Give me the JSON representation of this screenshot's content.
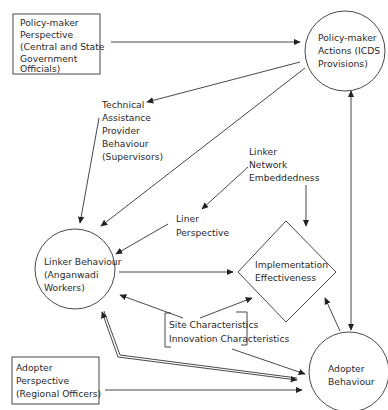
{
  "diagram": {
    "nodes": {
      "policy_perspective": {
        "shape": "rectangle",
        "lines": [
          "Policy-maker",
          "Perspective",
          "(Central and State",
          "Government",
          "Officials)"
        ]
      },
      "policy_actions": {
        "shape": "circle",
        "lines": [
          "Policy-maker",
          "Actions (ICDS",
          "Provisions)"
        ]
      },
      "technical_assistance": {
        "shape": "text",
        "lines": [
          "Technical",
          "Assistance",
          "Provider",
          "Behaviour",
          "(Supervisors)"
        ]
      },
      "linker_network": {
        "shape": "text",
        "lines": [
          "Linker",
          "Network",
          "Embeddedness"
        ]
      },
      "liner_perspective": {
        "shape": "text",
        "lines": [
          "Liner",
          "Perspective"
        ]
      },
      "linker_behaviour": {
        "shape": "circle",
        "lines": [
          "Linker Behaviour",
          "(Anganwadi",
          "Workers)"
        ]
      },
      "implementation": {
        "shape": "diamond",
        "lines": [
          "Implementation",
          "Effectiveness"
        ]
      },
      "characteristics": {
        "shape": "bracket",
        "lines": [
          "Site Characteristics",
          "Innovation Characteristics"
        ]
      },
      "adopter_perspective": {
        "shape": "rectangle",
        "lines": [
          "Adopter",
          "Perspective",
          "(Regional Officers)"
        ]
      },
      "adopter_behaviour": {
        "shape": "circle",
        "lines": [
          "Adopter",
          "Behaviour"
        ]
      }
    },
    "edges": [
      {
        "from": "Policy-maker Perspective",
        "to": "Policy-maker Actions (ICDS Provisions)",
        "style": "single"
      },
      {
        "from": "Policy-maker Actions (ICDS Provisions)",
        "to": "Technical Assistance Provider Behaviour (Supervisors)",
        "style": "single"
      },
      {
        "from": "Policy-maker Actions (ICDS Provisions)",
        "to": "Linker Behaviour (Anganwadi Workers)",
        "style": "single"
      },
      {
        "from": "Technical Assistance Provider Behaviour (Supervisors)",
        "to": "Linker Behaviour (Anganwadi Workers)",
        "style": "single"
      },
      {
        "from": "Linker Network Embeddedness",
        "to": "Liner Perspective",
        "style": "single"
      },
      {
        "from": "Linker Network Embeddedness",
        "to": "Implementation Effectiveness",
        "style": "single"
      },
      {
        "from": "Liner Perspective",
        "to": "Linker Behaviour (Anganwadi Workers)",
        "style": "single"
      },
      {
        "from": "Linker Behaviour (Anganwadi Workers)",
        "to": "Implementation Effectiveness",
        "style": "single"
      },
      {
        "from": "Site/Innovation Characteristics",
        "to": "Linker Behaviour (Anganwadi Workers)",
        "style": "single"
      },
      {
        "from": "Site/Innovation Characteristics",
        "to": "Implementation Effectiveness",
        "style": "single"
      },
      {
        "from": "Site/Innovation Characteristics",
        "to": "Adopter Behaviour",
        "style": "single"
      },
      {
        "from": "Linker Behaviour (Anganwadi Workers)",
        "to": "Adopter Behaviour",
        "style": "double-bidirectional"
      },
      {
        "from": "Adopter Perspective (Regional Officers)",
        "to": "Adopter Behaviour",
        "style": "single"
      },
      {
        "from": "Adopter Behaviour",
        "to": "Implementation Effectiveness",
        "style": "single"
      },
      {
        "from": "Adopter Behaviour",
        "to": "Policy-maker Actions (ICDS Provisions)",
        "style": "bidirectional"
      }
    ]
  }
}
